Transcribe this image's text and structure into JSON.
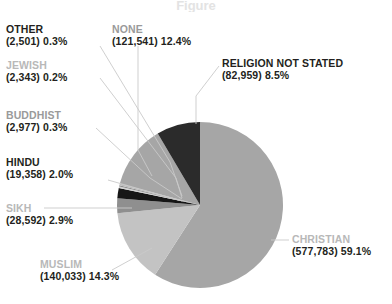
{
  "chart_data": {
    "type": "pie",
    "title": "",
    "xlabel": "",
    "ylabel": "",
    "legend_position": "callout-labels",
    "grid": false,
    "total": 977987,
    "categories": [
      "CHRISTIAN",
      "MUSLIM",
      "SIKH",
      "HINDU",
      "BUDDHIST",
      "JEWISH",
      "OTHER",
      "NONE",
      "RELIGION NOT STATED"
    ],
    "values": [
      577783,
      140033,
      28592,
      19358,
      2977,
      2343,
      2501,
      121541,
      82959
    ],
    "percentages": [
      59.1,
      14.3,
      2.9,
      2.0,
      0.3,
      0.2,
      0.3,
      12.4,
      8.5
    ],
    "colors": [
      "#a6a6a6",
      "#c3c3c3",
      "#8f8f8f",
      "#161616",
      "#d2d2d2",
      "#8f8f8f",
      "#bcbcbc",
      "#a6a6a6",
      "#2b2b2b"
    ],
    "slices": [
      {
        "name": "CHRISTIAN",
        "count": "577,783",
        "percent": "59.1%",
        "color": "#a6a6a6",
        "label_color": "#b8b8b8"
      },
      {
        "name": "MUSLIM",
        "count": "140,033",
        "percent": "14.3%",
        "color": "#c3c3c3",
        "label_color": "#b8b8b8"
      },
      {
        "name": "SIKH",
        "count": "28,592",
        "percent": "2.9%",
        "color": "#8f8f8f",
        "label_color": "#b8b8b8"
      },
      {
        "name": "HINDU",
        "count": "19,358",
        "percent": "2.0%",
        "color": "#161616",
        "label_color": "#231f20"
      },
      {
        "name": "BUDDHIST",
        "count": "2,977",
        "percent": "0.3%",
        "color": "#d2d2d2",
        "label_color": "#9a9a9a"
      },
      {
        "name": "JEWISH",
        "count": "2,343",
        "percent": "0.2%",
        "color": "#8f8f8f",
        "label_color": "#b8b8b8"
      },
      {
        "name": "OTHER",
        "count": "2,501",
        "percent": "0.3%",
        "color": "#bcbcbc",
        "label_color": "#231f20"
      },
      {
        "name": "NONE",
        "count": "121,541",
        "percent": "12.4%",
        "color": "#a6a6a6",
        "label_color": "#9a9a9a"
      },
      {
        "name": "RELIGION NOT STATED",
        "count": "82,959",
        "percent": "8.5%",
        "color": "#2b2b2b",
        "label_color": "#231f20"
      }
    ]
  },
  "labels": {
    "other": {
      "name": "OTHER",
      "value": "(2,501) 0.3%"
    },
    "jewish": {
      "name": "JEWISH",
      "value": "(2,343) 0.2%"
    },
    "buddhist": {
      "name": "BUDDHIST",
      "value": "(2,977) 0.3%"
    },
    "hindu": {
      "name": "HINDU",
      "value": "(19,358) 2.0%"
    },
    "sikh": {
      "name": "SIKH",
      "value": "(28,592) 2.9%"
    },
    "muslim": {
      "name": "MUSLIM",
      "value": "(140,033) 14.3%"
    },
    "none": {
      "name": "NONE",
      "value": "(121,541) 12.4%"
    },
    "religion_not_stated": {
      "name": "RELIGION NOT STATED",
      "value": "(82,959) 8.5%"
    },
    "christian": {
      "name": "CHRISTIAN",
      "value": "(577,783) 59.1%"
    }
  },
  "title_ghost": "Figure"
}
